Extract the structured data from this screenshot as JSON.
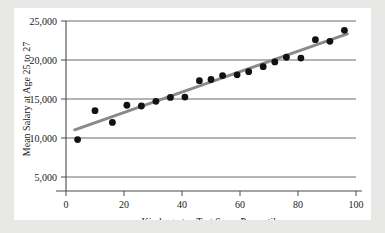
{
  "chart_data": {
    "type": "scatter",
    "title": "",
    "xlabel": "Kindergarten Test Score Percentile",
    "ylabel": "Mean Salary at Age 25 to 27",
    "xlim": [
      0,
      100
    ],
    "ylim": [
      5000,
      25000
    ],
    "xticks": [
      0,
      20,
      40,
      60,
      80,
      100
    ],
    "xtick_labels": [
      "0",
      "20",
      "40",
      "60",
      "80",
      "100"
    ],
    "yticks": [
      5000,
      10000,
      15000,
      20000,
      25000
    ],
    "ytick_labels": [
      "5,000",
      "10,000",
      "15,000",
      "20,000",
      "25,000"
    ],
    "grid": "horizontal",
    "legend": "none",
    "point_color": "#121212",
    "line_color": "#8a8a8a",
    "background_color": "#ffffff",
    "page_background_color": "#e8e8e6",
    "series": [
      {
        "name": "Mean salary by kindergarten percentile",
        "marker": "filled-circle",
        "x": [
          4,
          10,
          16,
          21,
          26,
          31,
          36,
          41,
          46,
          50,
          54,
          59,
          63,
          68,
          72,
          76,
          81,
          86,
          91,
          96
        ],
        "y": [
          9800,
          13500,
          12000,
          14200,
          14100,
          14700,
          15200,
          15250,
          17350,
          17500,
          18000,
          18100,
          18500,
          19150,
          19750,
          20350,
          20250,
          22600,
          22400,
          23800
        ]
      }
    ],
    "trend_line": {
      "name": "fitted regression line",
      "x": [
        3,
        97
      ],
      "y": [
        11050,
        23350
      ]
    }
  }
}
